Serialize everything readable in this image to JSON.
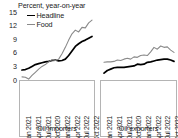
{
  "chart_data": {
    "type": "line",
    "title": "Percent, year-on-year",
    "xlabel": "",
    "ylabel": "",
    "ylim": [
      0,
      15
    ],
    "yticks": [
      15,
      12,
      9,
      6,
      3,
      0
    ],
    "grid": false,
    "legend": {
      "position": "top-left",
      "entries": [
        {
          "name": "Headline",
          "color": "#000000"
        },
        {
          "name": "Food",
          "color": "#8a8a8a"
        }
      ]
    },
    "panels": [
      {
        "id": "oil-importers",
        "caption": "Oil importers",
        "xticks": [
          "Jan 2021",
          "Apr 2021",
          "Jul 2021",
          "Oct 2020",
          "Jan 2022",
          "Apr 2022",
          "Jul 2022",
          "Oct 2022"
        ],
        "x": [
          "Jan 2021",
          "Feb 2021",
          "Mar 2021",
          "Apr 2021",
          "May 2021",
          "Jun 2021",
          "Jul 2021",
          "Aug 2021",
          "Sep 2021",
          "Oct 2021",
          "Nov 2021",
          "Dec 2021",
          "Jan 2022",
          "Feb 2022",
          "Mar 2022",
          "Apr 2022",
          "May 2022",
          "Jun 2022",
          "Jul 2022",
          "Aug 2022",
          "Sep 2022",
          "Oct 2022"
        ],
        "series": [
          {
            "name": "Headline",
            "color": "#000000",
            "values": [
              2.2,
              2.3,
              2.6,
              3.0,
              3.4,
              3.6,
              3.8,
              4.0,
              4.1,
              4.3,
              4.4,
              4.2,
              4.3,
              4.6,
              5.4,
              6.4,
              7.4,
              8.0,
              8.5,
              8.8,
              9.2,
              9.6
            ]
          },
          {
            "name": "Food",
            "color": "#8a8a8a",
            "values": [
              0.7,
              0.6,
              0.2,
              1.0,
              1.7,
              2.4,
              3.0,
              3.4,
              4.0,
              4.5,
              4.3,
              4.6,
              5.8,
              7.2,
              8.8,
              10.2,
              11.0,
              10.6,
              11.6,
              11.5,
              12.6,
              13.2
            ]
          }
        ]
      },
      {
        "id": "oil-exporters",
        "caption": "Oil exporters",
        "xticks": [
          "Jan 2021",
          "Apr 2021",
          "Jul 2021",
          "Oct 2020",
          "Jan 2022",
          "Apr 2022",
          "Jul 2022",
          "Oct 2022"
        ],
        "x": [
          "Jan 2021",
          "Feb 2021",
          "Mar 2021",
          "Apr 2021",
          "May 2021",
          "Jun 2021",
          "Jul 2021",
          "Aug 2021",
          "Sep 2021",
          "Oct 2021",
          "Nov 2021",
          "Dec 2021",
          "Jan 2022",
          "Feb 2022",
          "Mar 2022",
          "Apr 2022",
          "May 2022",
          "Jun 2022",
          "Jul 2022",
          "Aug 2022",
          "Sep 2022",
          "Oct 2022"
        ],
        "series": [
          {
            "name": "Headline",
            "color": "#000000",
            "values": [
              1.5,
              2.1,
              2.4,
              2.7,
              2.8,
              2.8,
              2.8,
              2.9,
              3.0,
              3.1,
              3.5,
              3.4,
              3.5,
              3.9,
              4.0,
              4.2,
              4.4,
              4.5,
              4.6,
              4.6,
              4.4,
              4.1
            ]
          },
          {
            "name": "Food",
            "color": "#8a8a8a",
            "values": [
              3.9,
              4.0,
              4.0,
              4.1,
              4.4,
              4.3,
              4.6,
              4.8,
              4.6,
              5.1,
              5.0,
              5.4,
              5.5,
              5.4,
              6.2,
              7.2,
              6.8,
              7.5,
              7.2,
              7.3,
              6.6,
              6.1
            ]
          }
        ]
      }
    ]
  }
}
